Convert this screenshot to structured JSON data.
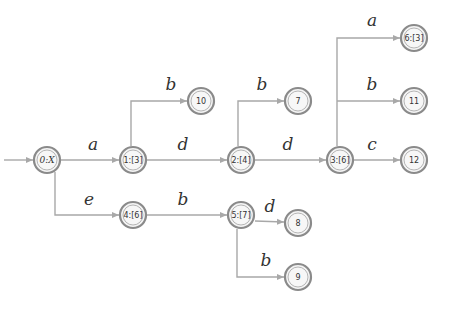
{
  "diagram": {
    "type": "automaton",
    "start_arrow": {
      "from": [
        4,
        160
      ],
      "to": [
        34,
        160
      ]
    },
    "nodes": [
      {
        "id": "n0",
        "label": "0:X",
        "x": 47,
        "y": 160,
        "italic": true
      },
      {
        "id": "n1",
        "label": "1:[3]",
        "x": 133,
        "y": 160
      },
      {
        "id": "n2",
        "label": "2:[4]",
        "x": 241,
        "y": 160
      },
      {
        "id": "n3",
        "label": "3:[6]",
        "x": 340,
        "y": 160
      },
      {
        "id": "n4",
        "label": "4:[6]",
        "x": 133,
        "y": 215
      },
      {
        "id": "n5",
        "label": "5:[7]",
        "x": 241,
        "y": 215
      },
      {
        "id": "n6",
        "label": "6:[3]",
        "x": 414,
        "y": 38
      },
      {
        "id": "n7",
        "label": "7",
        "x": 298,
        "y": 101
      },
      {
        "id": "n8",
        "label": "8",
        "x": 298,
        "y": 223
      },
      {
        "id": "n9",
        "label": "9",
        "x": 298,
        "y": 277
      },
      {
        "id": "n10",
        "label": "10",
        "x": 201,
        "y": 101
      },
      {
        "id": "n11",
        "label": "11",
        "x": 414,
        "y": 101
      },
      {
        "id": "n12",
        "label": "12",
        "x": 414,
        "y": 160
      }
    ],
    "edges": [
      {
        "from": "n0",
        "to": "n1",
        "label": "a",
        "label_x": 93,
        "label_y": 150
      },
      {
        "from": "n1",
        "to": "n2",
        "label": "d",
        "label_x": 183,
        "label_y": 150
      },
      {
        "from": "n2",
        "to": "n3",
        "label": "d",
        "label_x": 288,
        "label_y": 150
      },
      {
        "from": "n3",
        "to": "n12",
        "label": "c",
        "label_x": 372,
        "label_y": 150
      },
      {
        "from": "n1",
        "to": "n10",
        "label": "b",
        "label_x": 171,
        "label_y": 90
      },
      {
        "from": "n2",
        "to": "n7",
        "label": "b",
        "label_x": 262,
        "label_y": 90
      },
      {
        "from": "n3",
        "to": "n6",
        "label": "a",
        "label_x": 372,
        "label_y": 26
      },
      {
        "from": "n3",
        "to": "n11",
        "label": "b",
        "label_x": 372,
        "label_y": 90
      },
      {
        "from": "n0",
        "to": "n4",
        "label": "e",
        "label_x": 89,
        "label_y": 205
      },
      {
        "from": "n4",
        "to": "n5",
        "label": "b",
        "label_x": 183,
        "label_y": 205
      },
      {
        "from": "n5",
        "to": "n8",
        "label": "d",
        "label_x": 270,
        "label_y": 212
      },
      {
        "from": "n5",
        "to": "n9",
        "label": "b",
        "label_x": 266,
        "label_y": 266
      }
    ]
  },
  "colors": {
    "edge": "#a8a8a8",
    "node_border": "#8a8a8a",
    "node_fill": "#f4f4f4",
    "text": "#333333",
    "background": "#ffffff"
  }
}
